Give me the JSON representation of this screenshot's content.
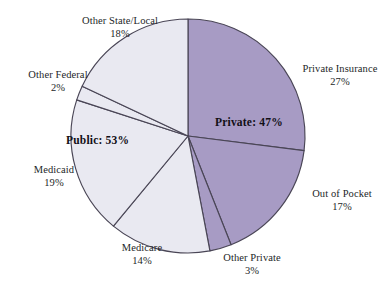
{
  "chart_data": {
    "type": "pie",
    "title": "",
    "subtitle": "",
    "xlabel": "",
    "ylabel": "",
    "legend_position": "callout-labels",
    "grid": false,
    "units": "percent",
    "total": 100,
    "start_angle_deg": 0,
    "direction": "clockwise",
    "categories": [
      "Private Insurance",
      "Out of Pocket",
      "Other Private",
      "Medicare",
      "Medicaid",
      "Other Federal",
      "Other State/Local"
    ],
    "values": [
      27,
      17,
      3,
      14,
      19,
      2,
      18
    ],
    "slices": [
      {
        "label": "Private Insurance",
        "value": 27,
        "value_text": "27%",
        "group": "Private",
        "color": "#a79bc4"
      },
      {
        "label": "Out of Pocket",
        "value": 17,
        "value_text": "17%",
        "group": "Private",
        "color": "#a79bc4"
      },
      {
        "label": "Other Private",
        "value": 3,
        "value_text": "3%",
        "group": "Private",
        "color": "#a79bc4"
      },
      {
        "label": "Medicare",
        "value": 14,
        "value_text": "14%",
        "group": "Public",
        "color": "#e9e9f1"
      },
      {
        "label": "Medicaid",
        "value": 19,
        "value_text": "19%",
        "group": "Public",
        "color": "#e9e9f1"
      },
      {
        "label": "Other Federal",
        "value": 2,
        "value_text": "2%",
        "group": "Public",
        "color": "#e9e9f1"
      },
      {
        "label": "Other State/Local",
        "value": 18,
        "value_text": "18%",
        "group": "Public",
        "color": "#e9e9f1"
      }
    ],
    "groups": [
      {
        "name": "Private",
        "value": 47,
        "label_text": "Private: 47%",
        "color": "#a79bc4"
      },
      {
        "name": "Public",
        "value": 53,
        "label_text": "Public: 53%",
        "color": "#e9e9f1"
      }
    ],
    "colors": {
      "private_fill": "#a79bc4",
      "public_fill": "#e9e9f1",
      "slice_outline": "#4a4656",
      "background": "#ffffff",
      "text": "#241f28"
    }
  },
  "labels": {
    "other_state_local": {
      "category": "Other State/Local",
      "value": "18%"
    },
    "other_federal": {
      "category": "Other Federal",
      "value": "2%"
    },
    "medicaid": {
      "category": "Medicaid",
      "value": "19%"
    },
    "medicare": {
      "category": "Medicare",
      "value": "14%"
    },
    "other_private": {
      "category": "Other Private",
      "value": "3%"
    },
    "private_insurance": {
      "category": "Private Insurance",
      "value": "27%"
    },
    "out_of_pocket": {
      "category": "Out of Pocket",
      "value": "17%"
    }
  },
  "group_labels": {
    "private": "Private: 47%",
    "public": "Public: 53%"
  }
}
